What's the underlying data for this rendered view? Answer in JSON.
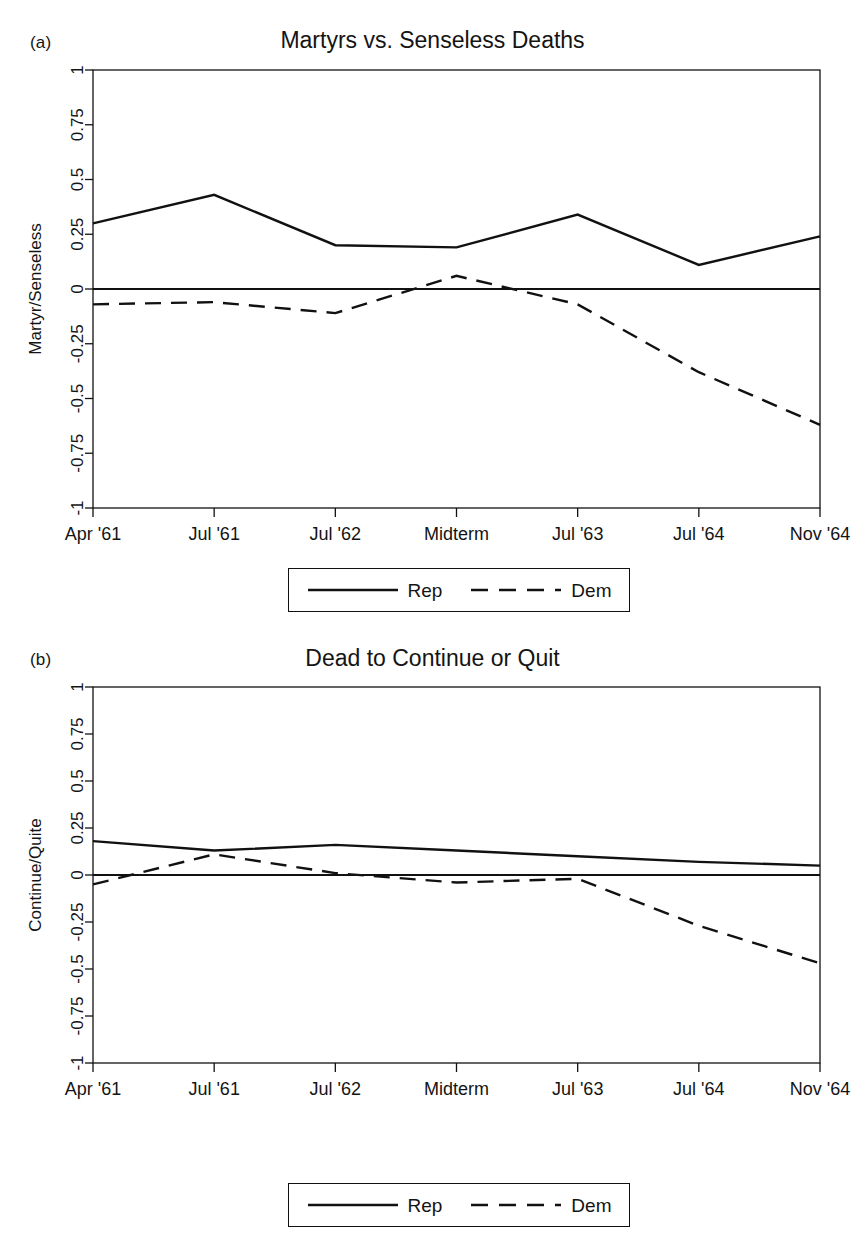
{
  "figure": {
    "panels": [
      {
        "letter": "(a)",
        "title": "Martyrs vs. Senseless Deaths",
        "ylabel": "Martyr/Senseless",
        "legend": {
          "rep": "Rep",
          "dem": "Dem"
        }
      },
      {
        "letter": "(b)",
        "title": "Dead to Continue or Quit",
        "ylabel": "Continue/Quite",
        "legend": {
          "rep": "Rep",
          "dem": "Dem"
        }
      }
    ]
  },
  "chart_data": [
    {
      "type": "line",
      "title": "Martyrs vs. Senseless Deaths",
      "panel": "(a)",
      "xlabel": "",
      "ylabel": "Martyr/Senseless",
      "categories": [
        "Apr '61",
        "Jul '61",
        "Jul '62",
        "Midterm",
        "Jul '63",
        "Jul '64",
        "Nov '64"
      ],
      "xticklabels": [
        "Apr '61",
        "Jul '61",
        "Jul '62",
        "Midterm",
        "Jul '63",
        "Jul '64",
        "Nov '64"
      ],
      "yticklabels": [
        "1",
        "0.75",
        "0.5",
        "0.25",
        "0",
        "-0.25",
        "-0.5",
        "-0.75",
        "-1"
      ],
      "ytickvalues": [
        1,
        0.75,
        0.5,
        0.25,
        0,
        -0.25,
        -0.5,
        -0.75,
        -1
      ],
      "ylim": [
        -1,
        1
      ],
      "grid": false,
      "zero_reference_line": 0,
      "legend_position": "below-axes",
      "series": [
        {
          "name": "Rep",
          "style": "solid",
          "values": [
            0.3,
            0.43,
            0.2,
            0.19,
            0.34,
            0.11,
            0.24
          ]
        },
        {
          "name": "Dem",
          "style": "dashed",
          "values": [
            -0.07,
            -0.06,
            -0.11,
            0.06,
            -0.07,
            -0.38,
            -0.62
          ]
        }
      ]
    },
    {
      "type": "line",
      "title": "Dead to Continue or Quit",
      "panel": "(b)",
      "xlabel": "",
      "ylabel": "Continue/Quite",
      "categories": [
        "Apr '61",
        "Jul '61",
        "Jul '62",
        "Midterm",
        "Jul '63",
        "Jul '64",
        "Nov '64"
      ],
      "xticklabels": [
        "Apr '61",
        "Jul '61",
        "Jul '62",
        "Midterm",
        "Jul '63",
        "Jul '64",
        "Nov '64"
      ],
      "yticklabels": [
        "1",
        "0.75",
        "0.5",
        "0.25",
        "0",
        "-0.25",
        "-0.5",
        "-0.75",
        "-1"
      ],
      "ytickvalues": [
        1,
        0.75,
        0.5,
        0.25,
        0,
        -0.25,
        -0.5,
        -0.75,
        -1
      ],
      "ylim": [
        -1,
        1
      ],
      "grid": false,
      "zero_reference_line": 0,
      "legend_position": "below-axes",
      "series": [
        {
          "name": "Rep",
          "style": "solid",
          "values": [
            0.18,
            0.13,
            0.16,
            0.13,
            0.1,
            0.07,
            0.05
          ]
        },
        {
          "name": "Dem",
          "style": "dashed",
          "values": [
            -0.05,
            0.11,
            0.01,
            -0.04,
            -0.02,
            -0.27,
            -0.47
          ]
        }
      ]
    }
  ]
}
